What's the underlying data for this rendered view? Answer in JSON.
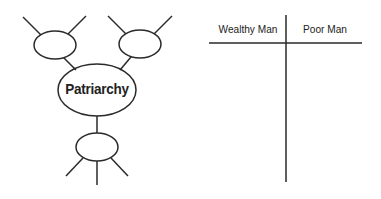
{
  "web": {
    "center_label": "Patriarchy"
  },
  "tchart": {
    "columns": [
      "Wealthy Man",
      "Poor Man"
    ]
  },
  "colors": {
    "stroke": "#2a2a2a",
    "background": "#ffffff"
  }
}
